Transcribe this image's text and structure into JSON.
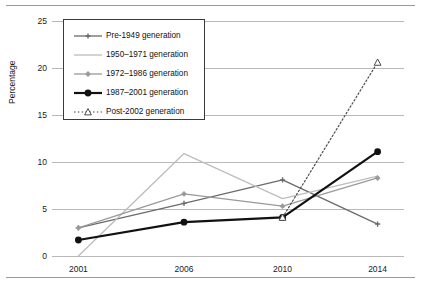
{
  "chart_data": {
    "type": "line",
    "title": "",
    "xlabel": "",
    "ylabel": "Percentage",
    "categories": [
      "2001",
      "2006",
      "2010",
      "2014"
    ],
    "ylim": [
      0,
      25
    ],
    "yticks": [
      0,
      5,
      10,
      15,
      20,
      25
    ],
    "grid": true,
    "legend_position": "upper-left-inside",
    "series": [
      {
        "name": "Pre-1949 generation",
        "values": [
          3.0,
          5.6,
          8.1,
          3.4
        ],
        "color": "#6b6b6b",
        "marker": "plus",
        "dash": "solid",
        "width": 1.3
      },
      {
        "name": "1950–1971 generation",
        "values": [
          0.0,
          10.9,
          6.1,
          8.5
        ],
        "color": "#bdbdbd",
        "marker": "none",
        "dash": "solid",
        "width": 1.3
      },
      {
        "name": "1972–1986 generation",
        "values": [
          3.0,
          6.6,
          5.3,
          8.3
        ],
        "color": "#9a9a9a",
        "marker": "diamond",
        "dash": "solid",
        "width": 1.3
      },
      {
        "name": "1987–2001 generation",
        "values": [
          1.7,
          3.6,
          4.1,
          11.1
        ],
        "color": "#111111",
        "marker": "circle",
        "dash": "solid",
        "width": 2.2
      },
      {
        "name": "Post-2002 generation",
        "values": [
          null,
          null,
          4.1,
          20.6
        ],
        "color": "#4d4d4d",
        "marker": "triangle-open",
        "dash": "dotted",
        "width": 1.2
      }
    ]
  },
  "axis": {
    "y_label": "Percentage",
    "y_tick_labels": [
      "0",
      "5",
      "10",
      "15",
      "20",
      "25"
    ],
    "x_tick_labels": [
      "2001",
      "2006",
      "2010",
      "2014"
    ]
  },
  "legend": {
    "items": [
      {
        "label": "Pre-1949 generation"
      },
      {
        "label": "1950–1971 generation"
      },
      {
        "label": "1972–1986 generation"
      },
      {
        "label": "1987–2001 generation"
      },
      {
        "label": "Post-2002 generation"
      }
    ]
  },
  "caption": {
    "text": ""
  }
}
